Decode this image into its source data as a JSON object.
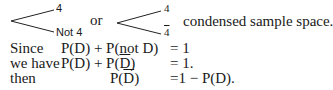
{
  "diagram": {
    "tree1": {
      "upper_label": "4",
      "lower_label": "Not 4"
    },
    "connector": "or",
    "tree2": {
      "upper_label": "4",
      "lower_label": "4"
    },
    "caption": "condensed sample space."
  },
  "equations": [
    {
      "lead": "Since",
      "lhs": "P(D) + P(not D)",
      "rhs": "= 1"
    },
    {
      "lead": "we have",
      "lhs_a": "P(D) + P(",
      "lhs_bar": "D",
      "lhs_b": ")",
      "rhs": "= 1."
    },
    {
      "lead": "then",
      "lhs_a": "P(",
      "lhs_bar": "D",
      "lhs_b": ")",
      "rhs": "=1 − P(D)."
    }
  ]
}
